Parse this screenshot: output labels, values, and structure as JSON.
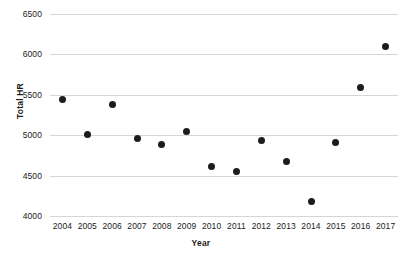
{
  "chart_data": {
    "type": "scatter",
    "title": "",
    "xlabel": "Year",
    "ylabel": "Total HR",
    "categories": [
      2004,
      2005,
      2006,
      2007,
      2008,
      2009,
      2010,
      2011,
      2012,
      2013,
      2014,
      2015,
      2016,
      2017
    ],
    "x": [
      2004,
      2005,
      2006,
      2007,
      2008,
      2009,
      2010,
      2011,
      2012,
      2013,
      2014,
      2015,
      2016,
      2017
    ],
    "values": [
      5440,
      5010,
      5385,
      4960,
      4880,
      5045,
      4610,
      4545,
      4940,
      4670,
      4180,
      4910,
      5590,
      6100
    ],
    "series": [
      {
        "name": "Total HR",
        "points": [
          {
            "x": 2004,
            "y": 5440
          },
          {
            "x": 2005,
            "y": 5010
          },
          {
            "x": 2006,
            "y": 5385
          },
          {
            "x": 2007,
            "y": 4960
          },
          {
            "x": 2008,
            "y": 4880
          },
          {
            "x": 2009,
            "y": 5045
          },
          {
            "x": 2010,
            "y": 4610
          },
          {
            "x": 2011,
            "y": 4545
          },
          {
            "x": 2012,
            "y": 4940
          },
          {
            "x": 2013,
            "y": 4670
          },
          {
            "x": 2014,
            "y": 4180
          },
          {
            "x": 2015,
            "y": 4910
          },
          {
            "x": 2016,
            "y": 5590
          },
          {
            "x": 2017,
            "y": 6100
          }
        ]
      }
    ],
    "xlim": [
      2003.5,
      2017.5
    ],
    "ylim": [
      4000,
      6500
    ],
    "ytick_labels": [
      "6500",
      "6000",
      "5500",
      "5000",
      "4500",
      "4000"
    ],
    "ytick_values": [
      6500,
      6000,
      5500,
      5000,
      4500,
      4000
    ],
    "xtick_labels": [
      "2004",
      "2005",
      "2006",
      "2007",
      "2008",
      "2009",
      "2010",
      "2011",
      "2012",
      "2013",
      "2014",
      "2015",
      "2016",
      "2017"
    ],
    "grid": "horizontal",
    "legend": "none",
    "marker_color": "#1c1c1c",
    "gridline_color": "#d6d6d6",
    "background_color": "#ffffff"
  }
}
